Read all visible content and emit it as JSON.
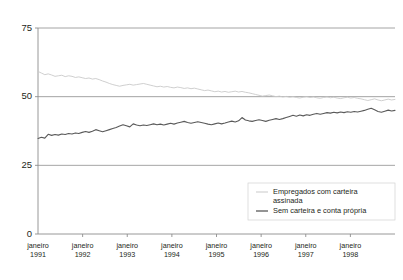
{
  "chart_data": {
    "type": "line",
    "title": "",
    "subtitle": "",
    "xlabel": "",
    "ylabel": "",
    "ylim": [
      0,
      75
    ],
    "yticks": [
      0,
      25,
      50,
      75
    ],
    "ytick_labels": [
      "0",
      "25",
      "50",
      "75"
    ],
    "grid": true,
    "grid_axis": "y",
    "legend_position": "bottom-right",
    "x_tick_labels": [
      {
        "month": "janeiro",
        "year": "1991"
      },
      {
        "month": "janeiro",
        "year": "1992"
      },
      {
        "month": "janeiro",
        "year": "1993"
      },
      {
        "month": "janeiro",
        "year": "1994"
      },
      {
        "month": "janeiro",
        "year": "1995"
      },
      {
        "month": "janeiro",
        "year": "1996"
      },
      {
        "month": "janeiro",
        "year": "1997"
      },
      {
        "month": "janeiro",
        "year": "1998"
      }
    ],
    "x_start": "janeiro 1991",
    "x_end": "1998",
    "x_unit": "month",
    "series": [
      {
        "name": "Empregados com carteira assinada",
        "color": "#c9c9c9",
        "legend_label_line1": "Empregados com carteira",
        "legend_label_line2": "assinada",
        "values": [
          59.2,
          58.6,
          58.0,
          58.3,
          57.9,
          57.4,
          57.6,
          57.8,
          57.3,
          57.6,
          57.4,
          57.0,
          57.2,
          56.9,
          56.6,
          56.8,
          56.4,
          56.6,
          56.2,
          55.7,
          55.3,
          54.8,
          54.4,
          54.1,
          53.8,
          54.1,
          54.3,
          54.5,
          54.2,
          54.4,
          54.6,
          54.8,
          54.5,
          54.2,
          53.9,
          53.6,
          53.8,
          53.5,
          53.7,
          53.4,
          53.2,
          53.5,
          53.3,
          53.0,
          53.2,
          52.9,
          53.1,
          52.8,
          52.5,
          52.2,
          52.4,
          52.1,
          51.8,
          52.0,
          51.7,
          51.9,
          51.6,
          51.8,
          52.0,
          51.7,
          51.9,
          51.6,
          51.4,
          51.1,
          50.8,
          50.5,
          50.2,
          50.4,
          50.6,
          50.3,
          50.0,
          50.2,
          49.9,
          50.1,
          49.8,
          50.0,
          49.7,
          49.5,
          49.8,
          50.0,
          49.7,
          49.9,
          49.6,
          49.4,
          49.7,
          49.9,
          49.6,
          49.8,
          49.5,
          49.3,
          49.6,
          49.8,
          49.5,
          49.7,
          49.4,
          49.2,
          48.9,
          48.6,
          48.9,
          49.2,
          48.8,
          48.5,
          48.8,
          49.1,
          48.8,
          49.0
        ]
      },
      {
        "name": "Sem carteira e conta própria",
        "color": "#5a5a5a",
        "legend_label_line1": "Sem carteira e conta própria",
        "legend_label_line2": "",
        "values": [
          34.8,
          35.2,
          34.9,
          36.3,
          35.9,
          36.2,
          36.0,
          36.4,
          36.2,
          36.6,
          36.4,
          36.8,
          36.6,
          37.0,
          37.3,
          37.0,
          37.4,
          38.0,
          37.6,
          37.2,
          37.6,
          38.0,
          38.4,
          38.8,
          39.3,
          39.8,
          39.4,
          39.0,
          40.1,
          39.7,
          39.4,
          39.7,
          39.5,
          39.8,
          40.1,
          39.8,
          40.0,
          39.7,
          40.0,
          40.3,
          40.0,
          40.4,
          40.7,
          41.0,
          40.6,
          40.3,
          40.6,
          40.9,
          40.6,
          40.3,
          40.0,
          39.8,
          40.1,
          40.4,
          40.1,
          40.4,
          40.8,
          41.1,
          40.8,
          41.2,
          42.4,
          41.5,
          41.2,
          41.0,
          41.3,
          41.6,
          41.3,
          41.0,
          41.4,
          41.7,
          42.0,
          41.7,
          42.0,
          42.4,
          42.8,
          43.2,
          42.9,
          43.3,
          43.0,
          43.4,
          43.2,
          43.6,
          43.9,
          43.6,
          43.9,
          44.2,
          44.0,
          44.3,
          44.1,
          44.4,
          44.2,
          44.5,
          44.3,
          44.6,
          44.4,
          44.7,
          45.0,
          45.4,
          45.8,
          45.2,
          44.6,
          44.3,
          44.7,
          45.1,
          44.8,
          45.0
        ]
      }
    ]
  },
  "geometry": {
    "plot_left": 38,
    "plot_right": 395,
    "plot_top": 28,
    "plot_bottom": 234,
    "legend_box": {
      "x": 248,
      "y": 183,
      "w": 147,
      "h": 37
    }
  }
}
